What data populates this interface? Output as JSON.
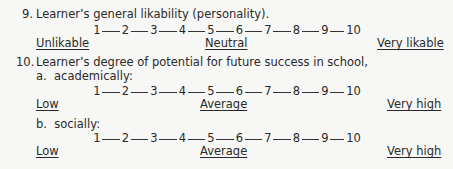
{
  "items": [
    {
      "number": "9.",
      "question": "Learner’s general likability (personality).",
      "scales": [
        {
          "sub_label": "",
          "points": [
            "1",
            "2",
            "3",
            "4",
            "5",
            "6",
            "7",
            "8",
            "9",
            "10"
          ],
          "anchors": {
            "low": "Unlikable",
            "mid": "Neutral",
            "high": "Very likable"
          }
        }
      ]
    },
    {
      "number": "10.",
      "question": "Learner’s degree of potential for future success in school,",
      "scales": [
        {
          "sub_label": "a.  academically:",
          "points": [
            "1",
            "2",
            "3",
            "4",
            "5",
            "6",
            "7",
            "8",
            "9",
            "10"
          ],
          "anchors": {
            "low": "Low",
            "mid": "Average",
            "high": "Very high"
          }
        },
        {
          "sub_label": "b.  socially:",
          "points": [
            "1",
            "2",
            "3",
            "4",
            "5",
            "6",
            "7",
            "8",
            "9",
            "10"
          ],
          "anchors": {
            "low": "Low",
            "mid": "Average",
            "high": "Very high"
          }
        }
      ]
    }
  ]
}
